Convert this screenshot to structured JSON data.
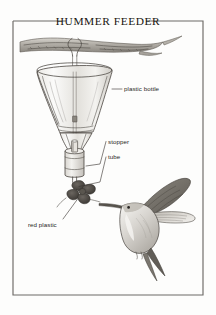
{
  "figure": {
    "title": "HUMMER FEEDER",
    "kind": "line-drawing-diagram",
    "background_color": "#fdfdfc",
    "ink_color": "#4a4540",
    "frame_color": "#6d6a66"
  },
  "labels": [
    {
      "id": "plastic-bottle",
      "text": "plastic bottle"
    },
    {
      "id": "stopper",
      "text": "stopper"
    },
    {
      "id": "tube",
      "text": "tube"
    },
    {
      "id": "red-plastic",
      "text": "red plastic"
    }
  ],
  "parts": [
    {
      "id": "branch",
      "name": "tree branch"
    },
    {
      "id": "hanger-wire",
      "name": "hanger wire"
    },
    {
      "id": "bottle",
      "name": "inverted plastic bottle"
    },
    {
      "id": "stopper-body",
      "name": "stopper"
    },
    {
      "id": "feed-tube",
      "name": "feeding tube"
    },
    {
      "id": "red-flower",
      "name": "red plastic flower"
    },
    {
      "id": "hummingbird",
      "name": "hummingbird"
    }
  ]
}
